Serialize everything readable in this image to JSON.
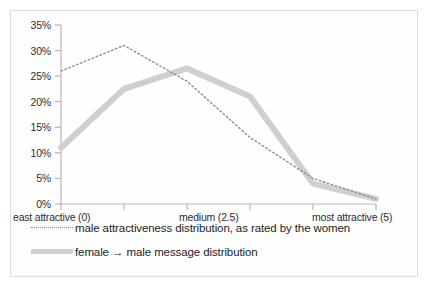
{
  "chart_data": {
    "type": "line",
    "title": "",
    "xlabel": "",
    "ylabel": "",
    "grid": false,
    "legend_position": "bottom",
    "x": [
      0,
      1,
      2,
      3,
      4,
      5
    ],
    "xtick_labels": [
      "east attractive (0)",
      "medium (2.5)",
      "most attractive (5)"
    ],
    "ytick_labels": [
      "0%",
      "5%",
      "10%",
      "15%",
      "20%",
      "25%",
      "30%",
      "35%"
    ],
    "ylim": [
      0,
      35
    ],
    "yticks": [
      0,
      5,
      10,
      15,
      20,
      25,
      30,
      35
    ],
    "series": [
      {
        "name": "male attractiveness distribution, as rated by the women",
        "style": "dotted",
        "color": "#8d8d8d",
        "values": [
          26,
          31,
          24,
          13,
          5,
          1
        ]
      },
      {
        "name": "female → male message distribution",
        "style": "thick-solid",
        "color": "#cfcfcf",
        "values": [
          11,
          22.5,
          26.5,
          21,
          4,
          1
        ]
      }
    ]
  },
  "axis": {
    "y_label_0": "0%",
    "y_label_5": "5%",
    "y_label_10": "10%",
    "y_label_15": "15%",
    "y_label_20": "20%",
    "y_label_25": "25%",
    "y_label_30": "30%",
    "y_label_35": "35%",
    "x_label_left": "east attractive (0)",
    "x_label_mid": "medium (2.5)",
    "x_label_right": "most attractive (5)"
  },
  "legend": {
    "items": [
      {
        "label": "male attractiveness distribution, as rated by the women"
      },
      {
        "label": "female → male message distribution"
      }
    ]
  },
  "colors": {
    "dotted_series": "#8d8d8d",
    "solid_series": "#cfcfcf",
    "axis": "#b5b5b5",
    "border": "#dcdcdc"
  }
}
